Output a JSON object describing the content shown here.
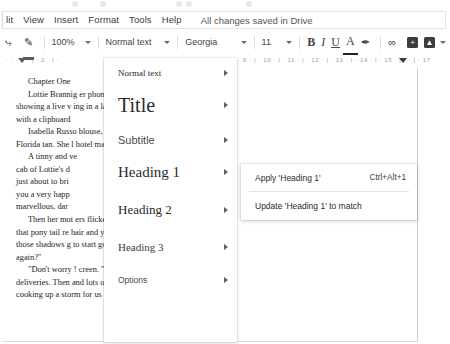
{
  "menubar": {
    "items": [
      "lit",
      "View",
      "Insert",
      "Format",
      "Tools",
      "Help"
    ],
    "save_status": "All changes saved in Drive"
  },
  "toolbar": {
    "paint_format_icon": "paint-format-icon",
    "zoom": "100%",
    "paragraph_style": "Normal text",
    "font": "Georgia",
    "font_size": "11",
    "bold": "B",
    "italic": "I",
    "underline": "U",
    "text_color": "A",
    "highlight_icon": "highlight-pen-icon",
    "link_icon": "link-icon",
    "comment_icon": "add-comment-icon",
    "image_icon": "insert-image-icon"
  },
  "ruler": {
    "left_labels": "·  ·  · 1 · | · 2 · | ·",
    "right_labels": "· 9 · | · 10 · | · 11 · | · 12 · | · 13 · | · 14 · | · 15 · | ·      · | · 17"
  },
  "styles_menu": {
    "items": [
      {
        "label": "Normal text",
        "kind": "normal-text"
      },
      {
        "label": "Title",
        "kind": "title"
      },
      {
        "label": "Subtitle",
        "kind": "subtitle"
      },
      {
        "label": "Heading 1",
        "kind": "heading-1"
      },
      {
        "label": "Heading 2",
        "kind": "heading-2"
      },
      {
        "label": "Heading 3",
        "kind": "heading-3"
      },
      {
        "label": "Options",
        "kind": "options"
      }
    ]
  },
  "submenu": {
    "apply_label": "Apply 'Heading 1'",
    "apply_shortcut": "Ctrl+Alt+1",
    "update_label": "Update 'Heading 1' to match"
  },
  "document": {
    "lines": [
      {
        "text": "Chapter One",
        "indent": true
      },
      {
        "text": "Lottie Brannig                                         er phone and smiled at the tiny screen",
        "indent": true
      },
      {
        "text": "showing a live v                                      ing in a large windowless meeting room",
        "indent": false
      },
      {
        "text": "with a clipboard",
        "indent": false
      },
      {
        "text": "Isabella Russo                                         blouse, caramel slacks, and her best",
        "indent": true
      },
      {
        "text": "Florida tan. She                                      l hotel manager and business woman.",
        "indent": false
      },
      {
        "text": "A tinny and ve",
        "indent": true
      },
      {
        "text": "cab of Lottie's d",
        "indent": false
      },
      {
        "text": "just about to bri",
        "indent": false
      },
      {
        "text": "you a very happ",
        "indent": false
      },
      {
        "text": "marvellous, dar",
        "indent": false
      },
      {
        "text": "Then her mot                                       ers flicked towards the screen. \"Although,",
        "indent": true
      },
      {
        "text": "that pony tail re                                   hair and you need to do something about",
        "indent": false
      },
      {
        "text": "those shadows                                     g to start going out and looking pretty",
        "indent": false
      },
      {
        "text": "again?\"",
        "indent": false
      },
      {
        "text": "\"Don't worry !                                      creen. \"I'm almost finished with the",
        "indent": true
      },
      {
        "text": "deliveries. Then                                   and lots of good food and wine. Rosa is",
        "indent": false
      },
      {
        "text": "cooking up a storm for us tonight.\"",
        "indent": false
      }
    ]
  }
}
